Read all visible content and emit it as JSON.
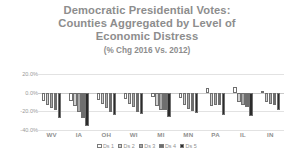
{
  "title": {
    "lines": [
      "Democratic Presidential Votes:",
      "Counties Aggregated by Level of",
      "Economic Distress"
    ],
    "subtitle": "(% Chg 2016 Vs. 2012)"
  },
  "colors": {
    "title": "#8d8d8d",
    "axis_text": "#9a9a9a",
    "gridline": "#e2e2e2",
    "series": [
      "#ffffff",
      "#d0d0d0",
      "#a8a8a8",
      "#6e6e6e",
      "#2b2b2b"
    ]
  },
  "chart_data": {
    "type": "bar",
    "title": "Democratic Presidential Votes: Counties Aggregated by Level of Economic Distress",
    "subtitle": "(% Chg 2016 Vs. 2012)",
    "xlabel": "",
    "ylabel": "",
    "ylim": [
      -40,
      20
    ],
    "yticks": [
      20,
      0,
      -20,
      -40
    ],
    "ytick_labels": [
      "20.0%",
      "0.0%",
      "-20.0%",
      "-40.0%"
    ],
    "grid": true,
    "legend_position": "bottom",
    "categories": [
      "WV",
      "IA",
      "OH",
      "WI",
      "MI",
      "MN",
      "PA",
      "IL",
      "IN"
    ],
    "series": [
      {
        "name": "Ds 1",
        "color": "#ffffff",
        "values": [
          -9.0,
          -8.5,
          -7.5,
          -6.5,
          -5.0,
          -5.5,
          4.5,
          6.0,
          1.5
        ]
      },
      {
        "name": "Ds 2",
        "color": "#d0d0d0",
        "values": [
          -13.0,
          -14.0,
          -12.0,
          -12.0,
          -14.5,
          -13.0,
          -14.0,
          -10.5,
          -9.5
        ]
      },
      {
        "name": "Ds 3",
        "color": "#a8a8a8",
        "values": [
          -16.0,
          -21.0,
          -16.5,
          -15.0,
          -18.5,
          -17.0,
          -13.5,
          -13.0,
          -12.5
        ]
      },
      {
        "name": "Ds 4",
        "color": "#6e6e6e",
        "values": [
          -18.5,
          -27.0,
          -20.5,
          -20.5,
          -19.0,
          -20.0,
          -13.0,
          -15.5,
          -13.5
        ]
      },
      {
        "name": "Ds 5",
        "color": "#2b2b2b",
        "values": [
          -27.0,
          -36.0,
          -24.0,
          -23.0,
          -26.0,
          -21.5,
          -24.0,
          -25.0,
          -18.5
        ]
      }
    ]
  }
}
